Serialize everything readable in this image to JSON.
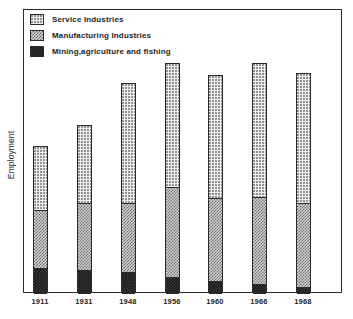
{
  "axes": {
    "ylabel": "Employment",
    "xlabel": ""
  },
  "legend": {
    "items": [
      {
        "label": "Service Industries",
        "key": "service",
        "swatch": "dotted-light-swatch",
        "color": "#efefef"
      },
      {
        "label": "Manufacturing Industries",
        "key": "manufacturing",
        "swatch": "checker-gray-swatch",
        "color": "#d2d2d2"
      },
      {
        "label": "Mining,agriculture and fishing",
        "key": "mining",
        "swatch": "solid-black-swatch",
        "color": "#1b1b1b"
      }
    ]
  },
  "chart_data": {
    "type": "bar",
    "subtype": "stacked-bar",
    "title": "",
    "xlabel": "",
    "ylabel": "Employment",
    "categories": [
      "1911",
      "1931",
      "1948",
      "1956",
      "1960",
      "1966",
      "1968"
    ],
    "series": [
      {
        "name": "Mining,agriculture and fishing",
        "values": [
          25,
          23,
          21,
          16,
          12,
          9,
          6
        ]
      },
      {
        "name": "Manufacturing Industries",
        "values": [
          58,
          67,
          69,
          90,
          83,
          87,
          84
        ]
      },
      {
        "name": "Service Industries",
        "values": [
          64,
          78,
          120,
          124,
          123,
          134,
          130
        ]
      }
    ],
    "totals": [
      147,
      168,
      210,
      230,
      218,
      230,
      220
    ],
    "ylim": [
      0,
      284
    ],
    "grid": false,
    "legend_position": "top-left",
    "axis_tick_labels_y": [],
    "note": "Values are pixel-height readings from the printed chart; the y axis is unlabelled (relative employment)."
  },
  "bars": [
    {
      "year": "1911",
      "x": 33,
      "top": 146,
      "service_h": 64,
      "manufacturing_h": 58,
      "mining_h": 25
    },
    {
      "year": "1931",
      "x": 77,
      "top": 125,
      "service_h": 78,
      "manufacturing_h": 67,
      "mining_h": 23
    },
    {
      "year": "1948",
      "x": 121,
      "top": 83,
      "service_h": 120,
      "manufacturing_h": 69,
      "mining_h": 21
    },
    {
      "year": "1956",
      "x": 165,
      "top": 63,
      "service_h": 124,
      "manufacturing_h": 90,
      "mining_h": 16
    },
    {
      "year": "1960",
      "x": 208,
      "top": 75,
      "service_h": 123,
      "manufacturing_h": 83,
      "mining_h": 12
    },
    {
      "year": "1966",
      "x": 252,
      "top": 63,
      "service_h": 134,
      "manufacturing_h": 87,
      "mining_h": 9
    },
    {
      "year": "1968",
      "x": 296,
      "top": 73,
      "service_h": 130,
      "manufacturing_h": 84,
      "mining_h": 6
    }
  ]
}
